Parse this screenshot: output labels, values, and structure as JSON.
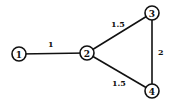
{
  "diagram": {
    "type": "weighted-undirected-graph",
    "nodes": [
      {
        "id": "1",
        "label": "1",
        "x": 19,
        "y": 54
      },
      {
        "id": "2",
        "label": "2",
        "x": 87,
        "y": 53
      },
      {
        "id": "3",
        "label": "3",
        "x": 152,
        "y": 13
      },
      {
        "id": "4",
        "label": "4",
        "x": 152,
        "y": 91
      }
    ],
    "edges": [
      {
        "from": "1",
        "to": "2",
        "weight": "1"
      },
      {
        "from": "2",
        "to": "3",
        "weight": "1.5"
      },
      {
        "from": "3",
        "to": "4",
        "weight": "2"
      },
      {
        "from": "2",
        "to": "4",
        "weight": "1.5"
      }
    ]
  }
}
